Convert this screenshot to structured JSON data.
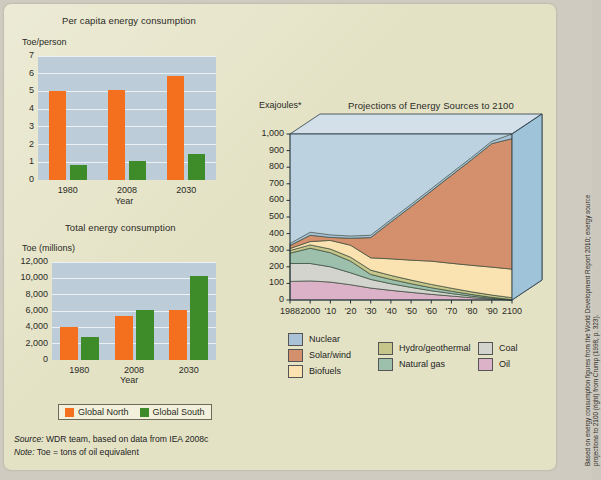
{
  "figure": {
    "background_color": "#e4e2c4",
    "credit_lines": [
      "Based on energy consumption figures from the World Development Report 2010; energy source",
      "projections to 2100 (right) from Crump (1998, p. 323)."
    ]
  },
  "source_note": {
    "source_label": "Source:",
    "source_text": " WDR team, based on data from IEA 2008c",
    "note_label": "Note:",
    "note_text": " Toe = tons of oil equivalent"
  },
  "bar_legend": {
    "north_label": "Global North",
    "south_label": "Global South",
    "north_color": "#f4701f",
    "south_color": "#3d8c29"
  },
  "chart_data": [
    {
      "id": "per-capita",
      "type": "bar",
      "title": "Per capita energy consumption",
      "ylabel": "Toe/person",
      "xlabel": "Year",
      "categories": [
        "1980",
        "2008",
        "2030"
      ],
      "yticks": [
        "0",
        "1",
        "2",
        "3",
        "4",
        "5",
        "6",
        "7"
      ],
      "ylim": [
        0,
        7
      ],
      "grid": true,
      "plot_background": "#bcccd8",
      "series": [
        {
          "name": "Global North",
          "color": "#f4701f",
          "values": [
            5.0,
            5.1,
            5.85
          ]
        },
        {
          "name": "Global South",
          "color": "#3d8c29",
          "values": [
            0.85,
            1.05,
            1.45
          ]
        }
      ]
    },
    {
      "id": "total-energy",
      "type": "bar",
      "title": "Total energy consumption",
      "ylabel": "Toe (millions)",
      "xlabel": "Year",
      "categories": [
        "1980",
        "2008",
        "2030"
      ],
      "yticks": [
        "0",
        "2,000",
        "4,000",
        "6,000",
        "8,000",
        "10,000",
        "12,000"
      ],
      "ylim": [
        0,
        12000
      ],
      "grid": true,
      "plot_background": "#bcccd8",
      "series": [
        {
          "name": "Global North",
          "color": "#f4701f",
          "values": [
            4100,
            5400,
            6100
          ]
        },
        {
          "name": "Global South",
          "color": "#3d8c29",
          "values": [
            2850,
            6100,
            10300
          ]
        }
      ]
    },
    {
      "id": "projections",
      "type": "area",
      "title": "Projections of Energy Sources to 2100",
      "ylabel": "Exajoules*",
      "xlabel": "",
      "yticks": [
        "0",
        "100",
        "200",
        "300",
        "400",
        "500",
        "600",
        "700",
        "800",
        "900",
        "1,000"
      ],
      "ylim": [
        0,
        1000
      ],
      "x": [
        1988,
        2000,
        2010,
        2020,
        2030,
        2040,
        2050,
        2060,
        2070,
        2080,
        2090,
        2100
      ],
      "xtick_labels": [
        "1988",
        "2000",
        "'10",
        "'20",
        "'30",
        "'40",
        "'50",
        "'60",
        "'70",
        "'80",
        "'90",
        "2100"
      ],
      "stack_order_bottom_to_top": [
        "Oil",
        "Coal",
        "Natural gas",
        "Hydro/geothermal",
        "Biofuels",
        "Solar/wind",
        "Nuclear"
      ],
      "legend_position": "below",
      "plot_background": "#bcd2e0",
      "series": [
        {
          "name": "Oil",
          "color": "#dcb2c8",
          "values": [
            112,
            115,
            108,
            92,
            72,
            58,
            46,
            34,
            24,
            14,
            6,
            0
          ]
        },
        {
          "name": "Coal",
          "color": "#d2d4cd",
          "values": [
            108,
            105,
            92,
            72,
            52,
            40,
            30,
            22,
            15,
            9,
            4,
            0
          ]
        },
        {
          "name": "Natural gas",
          "color": "#9dc0ac",
          "values": [
            62,
            92,
            85,
            70,
            30,
            26,
            22,
            18,
            14,
            10,
            6,
            2
          ]
        },
        {
          "name": "Hydro/geothermal",
          "color": "#c6c58a",
          "values": [
            16,
            20,
            22,
            24,
            26,
            24,
            22,
            20,
            18,
            16,
            14,
            12
          ]
        },
        {
          "name": "Biofuels",
          "color": "#fae3b0",
          "values": [
            12,
            20,
            52,
            72,
            74,
            100,
            120,
            140,
            150,
            160,
            168,
            172
          ]
        },
        {
          "name": "Solar/wind",
          "color": "#d4906c",
          "values": [
            18,
            38,
            18,
            42,
            122,
            222,
            322,
            422,
            530,
            636,
            744,
            786
          ]
        },
        {
          "name": "Nuclear",
          "color": "#a9c2d8",
          "values": [
            12,
            18,
            15,
            13,
            14,
            14,
            14,
            14,
            14,
            14,
            14,
            28
          ]
        }
      ],
      "legend_columns": [
        [
          "Nuclear",
          "Solar/wind",
          "Biofuels"
        ],
        [
          "Hydro/geothermal",
          "Natural gas"
        ],
        [
          "Coal",
          "Oil"
        ]
      ]
    }
  ]
}
